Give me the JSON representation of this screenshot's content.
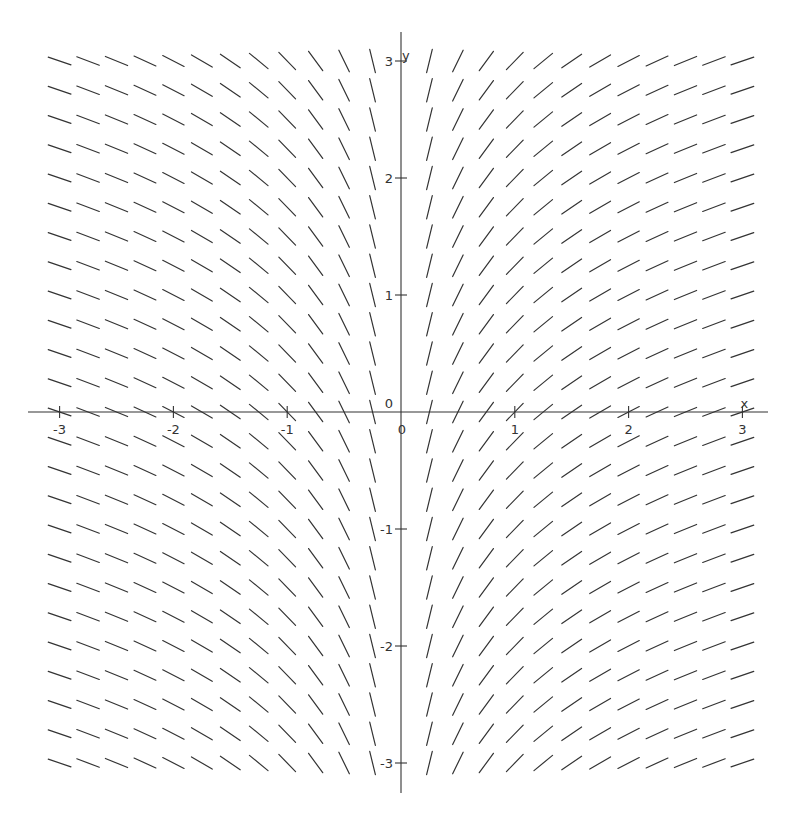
{
  "chart_data": {
    "type": "slope-field",
    "title": "",
    "equation": "dy/dx = 1/x",
    "xlabel": "x",
    "ylabel": "y",
    "xlim": [
      -3,
      3
    ],
    "ylim": [
      -3,
      3
    ],
    "grid": false,
    "x_samples": [
      -3,
      -2.75,
      -2.5,
      -2.25,
      -2,
      -1.75,
      -1.5,
      -1.25,
      -1,
      -0.75,
      -0.5,
      -0.25,
      0.25,
      0.5,
      0.75,
      1,
      1.25,
      1.5,
      1.75,
      2,
      2.25,
      2.5,
      2.75,
      3
    ],
    "y_samples": [
      3,
      2.75,
      2.5,
      2.25,
      2,
      1.75,
      1.5,
      1.25,
      1,
      0.75,
      0.5,
      0.25,
      0,
      -0.25,
      -0.5,
      -0.75,
      -1,
      -1.25,
      -1.5,
      -1.75,
      -2,
      -2.25,
      -2.5,
      -2.75,
      -3
    ],
    "x_ticks": [
      {
        "value": -3,
        "label": "-3"
      },
      {
        "value": -2,
        "label": "-2"
      },
      {
        "value": -1,
        "label": "-1"
      },
      {
        "value": 0,
        "label": "0"
      },
      {
        "value": 1,
        "label": "1"
      },
      {
        "value": 2,
        "label": "2"
      },
      {
        "value": 3,
        "label": "3"
      }
    ],
    "y_ticks": [
      {
        "value": 3,
        "label": "3"
      },
      {
        "value": 2,
        "label": "2"
      },
      {
        "value": 1,
        "label": "1"
      },
      {
        "value": 0,
        "label": "0"
      },
      {
        "value": -1,
        "label": "-1"
      },
      {
        "value": -2,
        "label": "-2"
      },
      {
        "value": -3,
        "label": "-3"
      }
    ],
    "color": "#333333"
  }
}
